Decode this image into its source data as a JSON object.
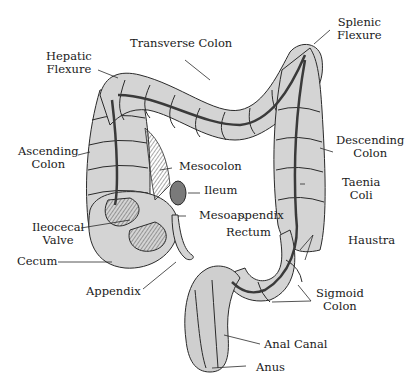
{
  "diagram": {
    "colors": {
      "fill": "#d4d4d4",
      "stroke": "#2a2a2a",
      "background": "#ffffff",
      "band": "#3a3a3a"
    },
    "labels": {
      "hepatic_flexure": {
        "line1": "Hepatic",
        "line2": "Flexure"
      },
      "transverse_colon": {
        "line1": "Transverse Colon"
      },
      "splenic_flexure": {
        "line1": "Splenic",
        "line2": "Flexure"
      },
      "ascending_colon": {
        "line1": "Ascending",
        "line2": "Colon"
      },
      "descending_colon": {
        "line1": "Descending",
        "line2": "Colon"
      },
      "mesocolon": {
        "line1": "Mesocolon"
      },
      "ileum": {
        "line1": "Ileum"
      },
      "taenia_coli": {
        "line1": "Taenia",
        "line2": "Coli"
      },
      "ileocecal_valve": {
        "line1": "Ileocecal",
        "line2": "Valve"
      },
      "mesoappendix": {
        "line1": "Mesoappendix"
      },
      "rectum": {
        "line1": "Rectum"
      },
      "haustra": {
        "line1": "Haustra"
      },
      "cecum": {
        "line1": "Cecum"
      },
      "appendix": {
        "line1": "Appendix"
      },
      "sigmoid_colon": {
        "line1": "Sigmoid",
        "line2": "Colon"
      },
      "anal_canal": {
        "line1": "Anal Canal"
      },
      "anus": {
        "line1": "Anus"
      }
    }
  }
}
